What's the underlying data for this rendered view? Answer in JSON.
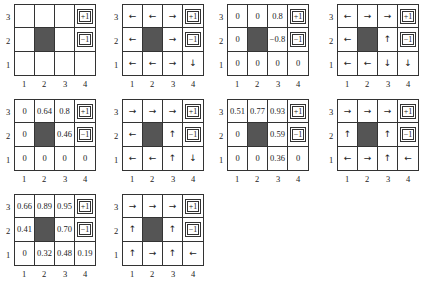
{
  "figure": {
    "axis": {
      "rows": [
        "3",
        "2",
        "1"
      ],
      "cols": [
        "1",
        "2",
        "3",
        "4"
      ]
    },
    "terminals": {
      "plus": "+1",
      "minus": "−1"
    },
    "colors": {
      "wall": "#555555",
      "grid_line": "#333333",
      "background": "#ffffff"
    },
    "panels": [
      {
        "id": "p1",
        "type": "blank",
        "cells": [
          [
            "",
            "",
            "",
            "+1"
          ],
          [
            "",
            "#",
            "",
            "−1"
          ],
          [
            "",
            "",
            "",
            ""
          ]
        ]
      },
      {
        "id": "p2",
        "type": "policy",
        "cells": [
          [
            "←",
            "←",
            "→",
            "+1"
          ],
          [
            "←",
            "#",
            "→",
            "−1"
          ],
          [
            "←",
            "←",
            "→",
            "↓"
          ]
        ]
      },
      {
        "id": "p3",
        "type": "values",
        "cells": [
          [
            "0",
            "0",
            "0.8",
            "+1"
          ],
          [
            "0",
            "#",
            "−0.8",
            "−1"
          ],
          [
            "0",
            "0",
            "0",
            "0"
          ]
        ]
      },
      {
        "id": "p4",
        "type": "policy",
        "cells": [
          [
            "←",
            "→",
            "→",
            "+1"
          ],
          [
            "←",
            "#",
            "↑",
            "−1"
          ],
          [
            "←",
            "←",
            "↓",
            "↓"
          ]
        ]
      },
      {
        "id": "p5",
        "type": "values",
        "cells": [
          [
            "0",
            "0.64",
            "0.8",
            "+1"
          ],
          [
            "0",
            "#",
            "0.46",
            "−1"
          ],
          [
            "0",
            "0",
            "0",
            "0"
          ]
        ]
      },
      {
        "id": "p6",
        "type": "policy",
        "cells": [
          [
            "→",
            "→",
            "→",
            "+1"
          ],
          [
            "←",
            "#",
            "↑",
            "−1"
          ],
          [
            "←",
            "←",
            "↑",
            "↓"
          ]
        ]
      },
      {
        "id": "p7",
        "type": "values",
        "cells": [
          [
            "0.51",
            "0.77",
            "0.93",
            "+1"
          ],
          [
            "0",
            "#",
            "0.59",
            "−1"
          ],
          [
            "0",
            "0",
            "0.36",
            "0"
          ]
        ]
      },
      {
        "id": "p8",
        "type": "policy",
        "cells": [
          [
            "→",
            "→",
            "→",
            "+1"
          ],
          [
            "↑",
            "#",
            "↑",
            "−1"
          ],
          [
            "←",
            "→",
            "↑",
            "←"
          ]
        ]
      },
      {
        "id": "p9",
        "type": "values",
        "cells": [
          [
            "0.66",
            "0.89",
            "0.95",
            "+1"
          ],
          [
            "0.41",
            "#",
            "0.70",
            "−1"
          ],
          [
            "0",
            "0.32",
            "0.48",
            "0.19"
          ]
        ]
      },
      {
        "id": "p10",
        "type": "policy",
        "cells": [
          [
            "→",
            "→",
            "→",
            "+1"
          ],
          [
            "↑",
            "#",
            "↑",
            "−1"
          ],
          [
            "↑",
            "→",
            "↑",
            "←"
          ]
        ]
      }
    ]
  }
}
